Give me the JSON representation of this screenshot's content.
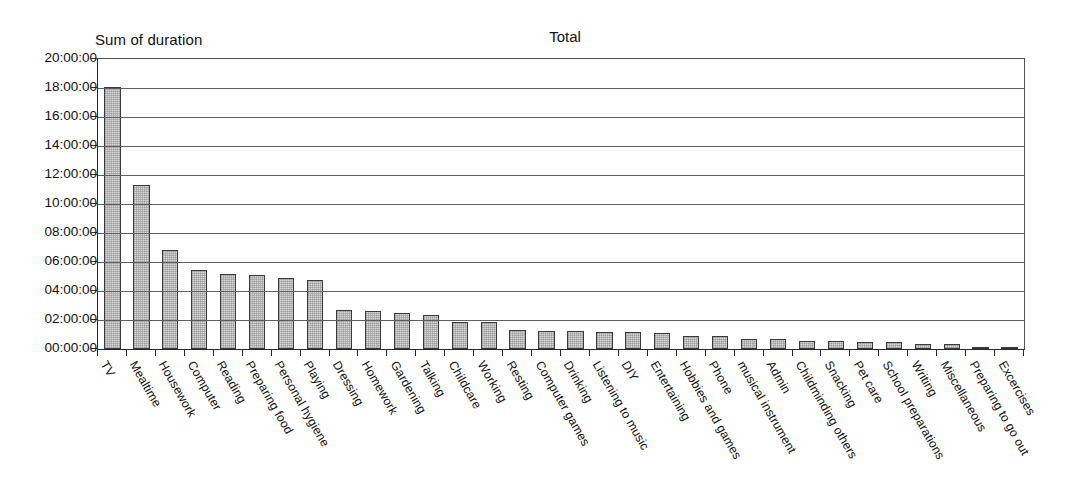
{
  "chart_data": {
    "type": "bar",
    "title": "Total",
    "ylabel": "Sum of duration",
    "xlabel": "",
    "grid": true,
    "legend": false,
    "ylim": [
      "00:00:00",
      "20:00:00"
    ],
    "ytick_labels": [
      "20:00:00",
      "18:00:00",
      "16:00:00",
      "14:00:00",
      "12:00:00",
      "10:00:00",
      "08:00:00",
      "06:00:00",
      "04:00:00",
      "02:00:00",
      "00:00:00"
    ],
    "categories": [
      "TV",
      "Mealtime",
      "Housework",
      "Computer",
      "Reading",
      "Preparing food",
      "Personal hygiene",
      "Playing",
      "Dressing",
      "Homework",
      "Gardening",
      "Talking",
      "Childcare",
      "Working",
      "Resting",
      "Computer games",
      "Drinking",
      "Listening to music",
      "DIY",
      "Entertaining",
      "Hobbies and games",
      "Phone",
      "musical instrument",
      "Admin",
      "Childminding others",
      "Snacking",
      "Pet care",
      "School preparations",
      "Writing",
      "Miscellaneous",
      "Preparing to go out",
      "Excercises"
    ],
    "value_labels": [
      "18:05:00",
      "11:20:00",
      "06:50:00",
      "05:25:00",
      "05:10:00",
      "05:05:00",
      "04:55:00",
      "04:45:00",
      "02:40:00",
      "02:38:00",
      "02:30:00",
      "02:22:00",
      "01:52:00",
      "01:50:00",
      "01:18:00",
      "01:15:00",
      "01:13:00",
      "01:12:00",
      "01:10:00",
      "01:05:00",
      "00:55:00",
      "00:54:00",
      "00:42:00",
      "00:40:00",
      "00:35:00",
      "00:33:00",
      "00:30:00",
      "00:28:00",
      "00:22:00",
      "00:20:00",
      "00:08:00",
      "00:05:00"
    ],
    "values": [
      18.083,
      11.333,
      6.833,
      5.417,
      5.167,
      5.083,
      4.917,
      4.75,
      2.667,
      2.633,
      2.5,
      2.367,
      1.867,
      1.833,
      1.3,
      1.25,
      1.217,
      1.2,
      1.167,
      1.083,
      0.917,
      0.9,
      0.7,
      0.667,
      0.583,
      0.55,
      0.5,
      0.467,
      0.367,
      0.333,
      0.133,
      0.083
    ],
    "bar_color": "#d9d9d9",
    "bar_border_color": "#3a3a3a",
    "y_max": 20,
    "y_step": 2
  }
}
